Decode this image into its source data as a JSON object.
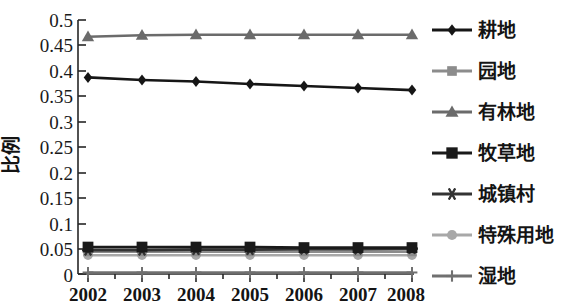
{
  "chart_data": {
    "type": "line",
    "title": "",
    "subtitle": "",
    "xlabel": "",
    "ylabel": "比例",
    "categories": [
      "2002",
      "2003",
      "2004",
      "2005",
      "2006",
      "2007",
      "2008"
    ],
    "x": [
      2002,
      2003,
      2004,
      2005,
      2006,
      2007,
      2008
    ],
    "xlim": [
      2002,
      2008
    ],
    "ylim": [
      0,
      0.5
    ],
    "ytick_labels": [
      "0",
      "0.05",
      "0.1",
      "0.15",
      "0.2",
      "0.25",
      "0.3",
      "0.35",
      "0.4",
      "0.45",
      "0.5"
    ],
    "ytick_values": [
      0,
      0.05,
      0.1,
      0.15,
      0.2,
      0.25,
      0.3,
      0.35,
      0.4,
      0.45,
      0.5
    ],
    "grid": false,
    "legend_position": "right",
    "series": [
      {
        "name": "耕地",
        "marker": "diamond",
        "color": "#161616",
        "values": [
          0.387,
          0.382,
          0.379,
          0.374,
          0.37,
          0.366,
          0.362
        ]
      },
      {
        "name": "园地",
        "marker": "square",
        "color": "#8c8c8c",
        "values": [
          0.044,
          0.044,
          0.044,
          0.044,
          0.044,
          0.044,
          0.044
        ]
      },
      {
        "name": "有林地",
        "marker": "triangle",
        "color": "#6b6b6b",
        "values": [
          0.467,
          0.47,
          0.471,
          0.471,
          0.471,
          0.471,
          0.471
        ]
      },
      {
        "name": "牧草地",
        "marker": "filled-square",
        "color": "#1a1a1a",
        "values": [
          0.053,
          0.053,
          0.053,
          0.053,
          0.052,
          0.052,
          0.052
        ]
      },
      {
        "name": "城镇村",
        "marker": "asterisk",
        "color": "#333333",
        "values": [
          0.047,
          0.047,
          0.048,
          0.048,
          0.049,
          0.049,
          0.05
        ]
      },
      {
        "name": "特殊用地",
        "marker": "circle",
        "color": "#a8a8a8",
        "values": [
          0.037,
          0.037,
          0.037,
          0.037,
          0.037,
          0.037,
          0.037
        ]
      },
      {
        "name": "湿地",
        "marker": "plus",
        "color": "#707070",
        "values": [
          0.003,
          0.003,
          0.003,
          0.003,
          0.003,
          0.003,
          0.003
        ]
      }
    ]
  },
  "axis": {
    "y_label": "比例",
    "y_ticks": [
      "0.5",
      "0.45",
      "0.4",
      "0.35",
      "0.3",
      "0.25",
      "0.2",
      "0.15",
      "0.1",
      "0.05",
      "0"
    ],
    "x_ticks": [
      "2002",
      "2003",
      "2004",
      "2005",
      "2006",
      "2007",
      "2008"
    ]
  },
  "legend": {
    "items": [
      {
        "label": "耕地",
        "marker": "diamond",
        "color": "#161616"
      },
      {
        "label": "园地",
        "marker": "square",
        "color": "#8c8c8c"
      },
      {
        "label": "有林地",
        "marker": "triangle",
        "color": "#6b6b6b"
      },
      {
        "label": "牧草地",
        "marker": "filled-square",
        "color": "#1a1a1a"
      },
      {
        "label": "城镇村",
        "marker": "asterisk",
        "color": "#333333"
      },
      {
        "label": "特殊用地",
        "marker": "circle",
        "color": "#a8a8a8"
      },
      {
        "label": "湿地",
        "marker": "plus",
        "color": "#707070"
      }
    ]
  }
}
